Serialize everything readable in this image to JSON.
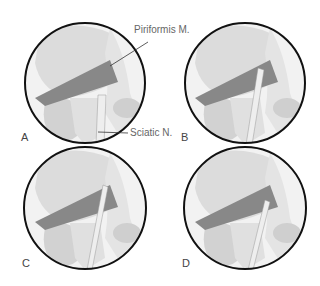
{
  "panels": [
    {
      "id": "A",
      "label": "A",
      "cx": 85,
      "cy": 83,
      "nerve": "below"
    },
    {
      "id": "B",
      "label": "B",
      "cx": 245,
      "cy": 83,
      "nerve": "through"
    },
    {
      "id": "C",
      "label": "C",
      "cx": 85,
      "cy": 208,
      "nerve": "split"
    },
    {
      "id": "D",
      "label": "D",
      "cx": 245,
      "cy": 208,
      "nerve": "above"
    }
  ],
  "annotations": {
    "piriformis": "Piriformis M.",
    "sciatic": "Sciatic N."
  },
  "colors": {
    "outline": "#111111",
    "bone": "#d9d9d9",
    "muscle": "#7a7a7a",
    "nerve": "#e8e8e8"
  }
}
